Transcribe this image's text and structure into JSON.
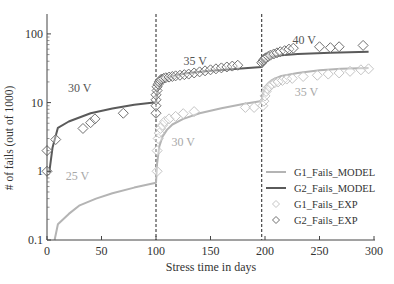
{
  "chart_data": {
    "type": "line",
    "title": "",
    "xlabel": "Stress time in days",
    "ylabel": "# of fails (out of 1000)",
    "xlim": [
      0,
      300
    ],
    "ylim": [
      0.1,
      200
    ],
    "yscale": "log",
    "xticks": [
      0,
      50,
      100,
      150,
      200,
      250,
      300
    ],
    "xtick_labels": [
      "0",
      "50",
      "100",
      "150",
      "200",
      "250",
      "300"
    ],
    "yticks": [
      0.1,
      1,
      10,
      100
    ],
    "ytick_labels": [
      "0.1",
      "1",
      "10",
      "100"
    ],
    "grid": false,
    "legend_position": "lower right",
    "vlines": [
      100,
      197
    ],
    "annotations": [
      {
        "text": "25 V",
        "x": 28,
        "y": 0.75,
        "color": "#a8a8a8"
      },
      {
        "text": "30 V",
        "x": 30,
        "y": 14.5,
        "color": "#555555"
      },
      {
        "text": "30 V",
        "x": 125,
        "y": 2.3,
        "color": "#a8a8a8"
      },
      {
        "text": "35 V",
        "x": 136,
        "y": 35,
        "color": "#555555"
      },
      {
        "text": "35 V",
        "x": 238,
        "y": 12.5,
        "color": "#a8a8a8"
      },
      {
        "text": "40 V",
        "x": 236,
        "y": 72,
        "color": "#555555"
      }
    ],
    "series": [
      {
        "name": "G1_Fails_MODEL",
        "kind": "line",
        "color": "#b4b4b4",
        "x": [
          7,
          10,
          20,
          30,
          45,
          60,
          80,
          100,
          100,
          101,
          103,
          106,
          110,
          115,
          125,
          140,
          160,
          180,
          197,
          197,
          198,
          200,
          203,
          208,
          215,
          230,
          250,
          270,
          295
        ],
        "y": [
          0.1,
          0.17,
          0.24,
          0.32,
          0.4,
          0.48,
          0.58,
          0.68,
          0.68,
          1.3,
          2.3,
          3.2,
          4.0,
          4.8,
          5.8,
          7.0,
          8.3,
          9.5,
          10.5,
          10.5,
          13,
          16,
          19,
          22,
          24.5,
          27,
          29.5,
          31,
          32
        ]
      },
      {
        "name": "G2_Fails_MODEL",
        "kind": "line",
        "color": "#5a5a5a",
        "x": [
          2,
          5,
          10,
          20,
          40,
          60,
          80,
          100,
          100,
          101,
          103,
          106,
          110,
          118,
          130,
          150,
          175,
          197,
          197,
          198,
          200,
          205,
          215,
          230,
          260,
          295
        ],
        "y": [
          0.95,
          2.2,
          4.3,
          5.3,
          7.0,
          8.2,
          9.3,
          10.1,
          10.1,
          14,
          18,
          21,
          23,
          25,
          27,
          29,
          31,
          33,
          33,
          38,
          42,
          46,
          49,
          51,
          53,
          55
        ]
      },
      {
        "name": "G1_Fails_EXP",
        "kind": "scatter",
        "marker": "diamond-open",
        "color": "#c4c4c4",
        "x": [
          101,
          101,
          102,
          103,
          104,
          106,
          108,
          112,
          118,
          125,
          135,
          182,
          190,
          198,
          199,
          200,
          201,
          202,
          204,
          206,
          209,
          212,
          216,
          220,
          225,
          235,
          248,
          258,
          268,
          278,
          288,
          295
        ],
        "y": [
          1.0,
          2.0,
          3.0,
          3.6,
          4.2,
          4.7,
          5.3,
          5.8,
          6.3,
          6.9,
          7.4,
          8.5,
          8.5,
          9.0,
          10.5,
          12.5,
          14.5,
          16,
          17,
          18.5,
          19.5,
          20,
          21,
          22,
          22.5,
          24,
          25,
          26,
          27,
          28.5,
          30,
          31
        ]
      },
      {
        "name": "G2_Fails_EXP",
        "kind": "scatter",
        "marker": "diamond-open",
        "color": "#6e6e6e",
        "x": [
          0,
          0,
          8,
          33,
          40,
          44,
          70,
          100,
          100,
          100,
          100,
          101,
          101,
          102,
          103,
          104,
          105,
          107,
          109,
          112,
          115,
          118,
          122,
          126,
          130,
          135,
          140,
          145,
          150,
          155,
          160,
          165,
          170,
          175,
          197,
          198,
          199,
          200,
          201,
          203,
          205,
          208,
          211,
          214,
          218,
          222,
          226,
          250,
          260,
          268,
          290
        ],
        "y": [
          1.0,
          2.0,
          2.9,
          4.2,
          5.1,
          5.8,
          7.0,
          7.0,
          9.0,
          11,
          13,
          15,
          17,
          18.5,
          20,
          21,
          22,
          22.5,
          23,
          23.5,
          24,
          24.5,
          25,
          25.5,
          26,
          27,
          28,
          29,
          30,
          31,
          32,
          33,
          34,
          35,
          38,
          40,
          42,
          44,
          45,
          47,
          49,
          51,
          53,
          55,
          57,
          60,
          62,
          65,
          63,
          65,
          68
        ]
      }
    ]
  },
  "legend": {
    "items": [
      {
        "label": "G1_Fails_MODEL",
        "kind": "line",
        "color": "#b4b4b4"
      },
      {
        "label": "G2_Fails_MODEL",
        "kind": "line",
        "color": "#5a5a5a"
      },
      {
        "label": "G1_Fails_EXP",
        "kind": "marker",
        "color": "#c4c4c4"
      },
      {
        "label": "G2_Fails_EXP",
        "kind": "marker",
        "color": "#6e6e6e"
      }
    ]
  }
}
